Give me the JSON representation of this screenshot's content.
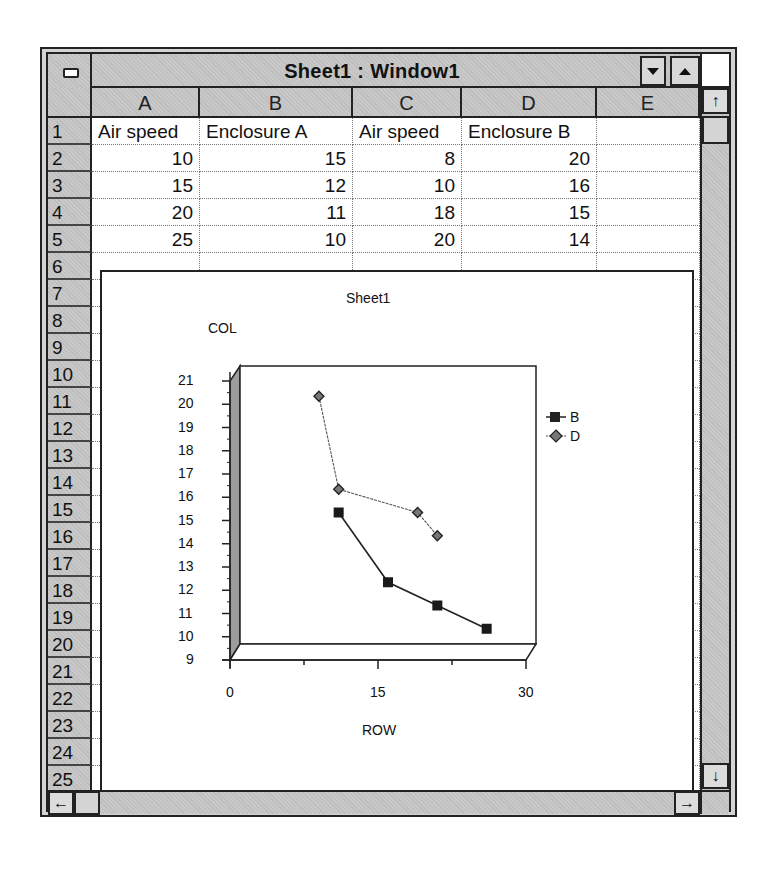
{
  "window": {
    "title": "Sheet1 : Window1",
    "buttons": {
      "minimize": "minimize-arrow",
      "maximize": "maximize-arrow",
      "system_menu": "control-menu"
    }
  },
  "sheet": {
    "columns": [
      "A",
      "B",
      "C",
      "D",
      "E"
    ],
    "row_numbers": [
      "1",
      "2",
      "3",
      "4",
      "5",
      "6",
      "7",
      "8",
      "9",
      "10",
      "11",
      "12",
      "13",
      "14",
      "15",
      "16",
      "17",
      "18",
      "19",
      "20",
      "21",
      "22",
      "23",
      "24",
      "25"
    ],
    "rows": [
      [
        "Air speed",
        "Enclosure A",
        "Air speed",
        "Enclosure B",
        ""
      ],
      [
        "10",
        "15",
        "8",
        "20",
        ""
      ],
      [
        "15",
        "12",
        "10",
        "16",
        ""
      ],
      [
        "20",
        "11",
        "18",
        "15",
        ""
      ],
      [
        "25",
        "10",
        "20",
        "14",
        ""
      ]
    ]
  },
  "scrollbars": {
    "up_arrow": "↑",
    "down_arrow": "↓",
    "left_arrow": "←",
    "right_arrow": "→"
  },
  "chart_data": {
    "type": "scatter",
    "title": "Sheet1",
    "xlabel": "ROW",
    "ylabel": "COL",
    "xlim": [
      0,
      30
    ],
    "ylim": [
      9,
      21
    ],
    "x_ticks": [
      "0",
      "15",
      "30"
    ],
    "y_ticks": [
      "9",
      "10",
      "11",
      "12",
      "13",
      "14",
      "15",
      "16",
      "17",
      "18",
      "19",
      "20",
      "21"
    ],
    "grid": false,
    "legend_position": "right",
    "style": "3d-walls",
    "series": [
      {
        "name": "B",
        "marker": "square",
        "x": [
          10,
          15,
          20,
          25
        ],
        "y": [
          15,
          12,
          11,
          10
        ]
      },
      {
        "name": "D",
        "marker": "diamond",
        "x": [
          8,
          10,
          18,
          20
        ],
        "y": [
          20,
          16,
          15,
          14
        ]
      }
    ]
  },
  "chart_labels": {
    "title": "Sheet1",
    "ylabel": "COL",
    "xlabel": "ROW",
    "legend": [
      "B",
      "D"
    ]
  }
}
